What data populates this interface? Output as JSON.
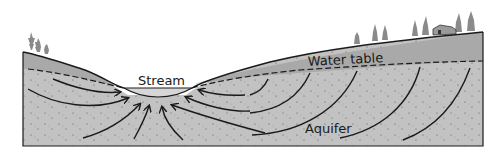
{
  "diagram": {
    "type": "groundwater-cross-section",
    "labels": {
      "stream": "Stream",
      "water_table": "Water table",
      "aquifer": "Aquifer"
    },
    "colors": {
      "background": "#ffffff",
      "unsaturated_zone": "#a9a9a9",
      "aquifer": "#c2c2c2",
      "outline": "#1a1a1a",
      "trees": "#8a8a8a"
    },
    "features": [
      "trees-left",
      "trees-right",
      "house",
      "stream",
      "water-table-dashed-line",
      "flow-arrows"
    ]
  }
}
